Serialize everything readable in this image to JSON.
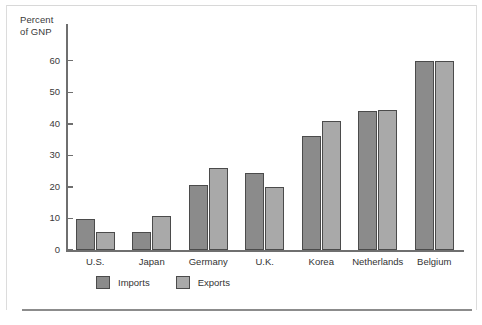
{
  "chart_data": {
    "type": "bar",
    "title": "",
    "subtitle": "",
    "xlabel": "",
    "ylabel": "Percent of GNP",
    "ylabel_lines": [
      "Percent",
      "of GNP"
    ],
    "categories": [
      "U.S.",
      "Japan",
      "Germany",
      "U.K.",
      "Korea",
      "Netherlands",
      "Belgium"
    ],
    "series": [
      {
        "name": "Imports",
        "color": "#8b8b8b",
        "values": [
          9.8,
          5.8,
          20.5,
          24.5,
          36.0,
          44.0,
          60.0
        ]
      },
      {
        "name": "Exports",
        "color": "#a9a9a9",
        "values": [
          5.8,
          10.7,
          26.0,
          20.0,
          41.0,
          44.3,
          60.0
        ]
      }
    ],
    "ylim": [
      0,
      65
    ],
    "yticks": [
      0,
      10,
      20,
      30,
      40,
      50,
      60
    ],
    "ytick_labels": [
      "0",
      "10",
      "20",
      "30",
      "40",
      "50",
      "60"
    ],
    "grid": false,
    "legend_position": "bottom-left"
  },
  "legend": {
    "items": [
      {
        "label": "Imports",
        "swatch": "imports-swatch"
      },
      {
        "label": "Exports",
        "swatch": "exports-swatch"
      }
    ]
  },
  "colors": {
    "imports": "#8b8b8b",
    "exports": "#a9a9a9",
    "axis": "#6f6f6f",
    "bar_border": "#4b4b4b",
    "text": "#333333",
    "frame": "#8c8c8c",
    "background": "#ffffff"
  }
}
